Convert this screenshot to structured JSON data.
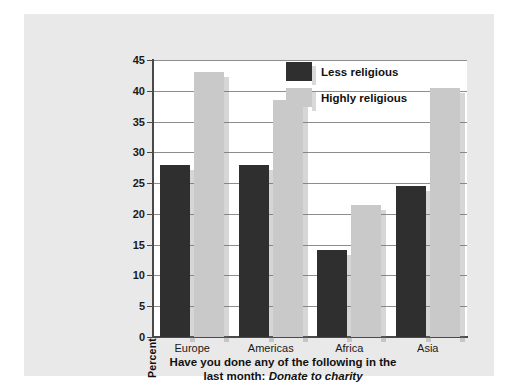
{
  "chart_data": {
    "type": "bar",
    "title": "",
    "caption_line1": "Have you done any of the following in the",
    "caption_line2_prefix": "last month:",
    "caption_line2_italic": "Donate to charity",
    "categories": [
      "Europe",
      "Americas",
      "Africa",
      "Asia"
    ],
    "series": [
      {
        "name": "Less religious",
        "color": "#2f2f2f",
        "values": [
          28.0,
          28.0,
          14.2,
          24.5
        ]
      },
      {
        "name": "Highly religious",
        "color": "#c9c9c9",
        "values": [
          43.0,
          38.5,
          21.4,
          40.5
        ]
      }
    ],
    "xlabel": "",
    "ylabel": "Percent",
    "ylim": [
      0,
      45
    ],
    "yticks": [
      0,
      5,
      10,
      15,
      20,
      25,
      30,
      35,
      40,
      45
    ],
    "ytick_labels": [
      "0",
      "5",
      "10",
      "15",
      "20",
      "25",
      "30",
      "35",
      "40",
      "45"
    ],
    "grid": true,
    "grid_axis": "y",
    "legend_position": "top-right"
  },
  "legend": {
    "items": [
      {
        "label": "Less religious"
      },
      {
        "label": "Highly religious"
      }
    ]
  },
  "axis": {
    "y_title": "Percent"
  },
  "colors": {
    "page_background": "#e9e9e9",
    "plot_background": "#ffffff",
    "gridline": "#8d8d8d",
    "axis": "#4a4a4a",
    "series_dark": "#2f2f2f",
    "series_light": "#c9c9c9"
  }
}
